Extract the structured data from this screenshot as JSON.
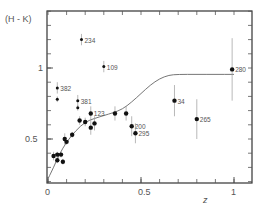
{
  "chart_data": {
    "type": "scatter",
    "title": "",
    "xlabel": "z",
    "ylabel": "(H - K)",
    "xlim": [
      0,
      1.1
    ],
    "ylim": [
      0.19,
      1.4
    ],
    "x_ticks": [
      {
        "value": 0,
        "label": "0"
      },
      {
        "value": 0.5,
        "label": "0.5"
      },
      {
        "value": 1,
        "label": "1"
      }
    ],
    "y_ticks": [
      {
        "value": 0.5,
        "label": "0.5"
      },
      {
        "value": 1,
        "label": "1"
      }
    ],
    "minor_x_step": 0.1,
    "minor_y_step": 0.1,
    "grid": false,
    "legend": null,
    "series": [
      {
        "name": "observed",
        "marker": "filled-circle",
        "points": [
          {
            "x": 0.03,
            "y": 0.38,
            "err": 0.03,
            "label": ""
          },
          {
            "x": 0.05,
            "y": 0.39,
            "err": 0.02,
            "label": ""
          },
          {
            "x": 0.07,
            "y": 0.39,
            "err": 0.02,
            "label": ""
          },
          {
            "x": 0.05,
            "y": 0.35,
            "err": 0.02,
            "label": ""
          },
          {
            "x": 0.08,
            "y": 0.34,
            "err": 0.02,
            "label": ""
          },
          {
            "x": 0.09,
            "y": 0.5,
            "err": 0.04,
            "label": ""
          },
          {
            "x": 0.1,
            "y": 0.48,
            "err": 0.02,
            "label": ""
          },
          {
            "x": 0.13,
            "y": 0.53,
            "err": 0.02,
            "label": ""
          },
          {
            "x": 0.17,
            "y": 0.63,
            "err": 0.03,
            "label": ""
          },
          {
            "x": 0.2,
            "y": 0.62,
            "err": 0.03,
            "label": ""
          },
          {
            "x": 0.23,
            "y": 0.68,
            "err": 0.05,
            "label": "123"
          },
          {
            "x": 0.23,
            "y": 0.58,
            "err": 0.05,
            "label": ""
          },
          {
            "x": 0.25,
            "y": 0.61,
            "err": 0.05,
            "label": ""
          },
          {
            "x": 0.36,
            "y": 0.68,
            "err": 0.05,
            "label": ""
          },
          {
            "x": 0.42,
            "y": 0.68,
            "err": 0.05,
            "label": ""
          },
          {
            "x": 0.45,
            "y": 0.59,
            "err": 0.07,
            "label": "200"
          },
          {
            "x": 0.47,
            "y": 0.54,
            "err": 0.07,
            "label": "295"
          },
          {
            "x": 0.68,
            "y": 0.77,
            "err": 0.11,
            "label": "34"
          },
          {
            "x": 0.8,
            "y": 0.64,
            "err": 0.14,
            "label": "265"
          },
          {
            "x": 0.99,
            "y": 0.99,
            "err": 0.22,
            "label": "280"
          }
        ]
      },
      {
        "name": "labelled-upper",
        "marker": "small-filled",
        "points": [
          {
            "x": 0.05,
            "y": 0.86,
            "err": 0.04,
            "label": "382"
          },
          {
            "x": 0.05,
            "y": 0.78,
            "err": 0.02,
            "label": ""
          },
          {
            "x": 0.16,
            "y": 0.77,
            "err": 0.04,
            "label": "381"
          },
          {
            "x": 0.16,
            "y": 0.72,
            "err": 0.02,
            "label": ""
          },
          {
            "x": 0.3,
            "y": 1.01,
            "err": 0.04,
            "label": "109"
          },
          {
            "x": 0.18,
            "y": 1.2,
            "err": 0.04,
            "label": "234"
          }
        ]
      }
    ],
    "curve": {
      "name": "model",
      "points": [
        [
          0.0,
          0.22
        ],
        [
          0.03,
          0.3
        ],
        [
          0.06,
          0.39
        ],
        [
          0.1,
          0.48
        ],
        [
          0.15,
          0.56
        ],
        [
          0.2,
          0.62
        ],
        [
          0.25,
          0.645
        ],
        [
          0.3,
          0.665
        ],
        [
          0.35,
          0.685
        ],
        [
          0.4,
          0.71
        ],
        [
          0.45,
          0.76
        ],
        [
          0.5,
          0.82
        ],
        [
          0.55,
          0.88
        ],
        [
          0.6,
          0.925
        ],
        [
          0.65,
          0.95
        ],
        [
          0.7,
          0.955
        ],
        [
          0.8,
          0.955
        ],
        [
          0.9,
          0.955
        ],
        [
          1.0,
          0.955
        ],
        [
          1.1,
          0.955
        ]
      ]
    }
  }
}
